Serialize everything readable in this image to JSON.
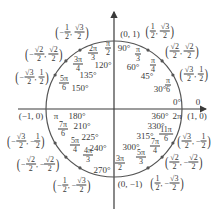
{
  "diagram": {
    "center": {
      "x": 114,
      "y": 109
    },
    "radius": 68,
    "colors": {
      "axis": "#3a3a3a",
      "circle": "#555555",
      "text": "#3a3a3a"
    },
    "axes": {
      "x": {
        "from": 18,
        "to": 206
      },
      "y": {
        "from": 209,
        "to": 12
      }
    },
    "points": [
      {
        "deg": "0°",
        "rad": "0",
        "coord": "(1, 0)"
      },
      {
        "deg": "30°",
        "rad": "π/6",
        "coord": "(√3/2, 1/2)"
      },
      {
        "deg": "45°",
        "rad": "π/4",
        "coord": "(√2/2, √2/2)"
      },
      {
        "deg": "60°",
        "rad": "π/3",
        "coord": "(1/2, √3/2)"
      },
      {
        "deg": "90°",
        "rad": "π/2",
        "coord": "(0, 1)"
      },
      {
        "deg": "120°",
        "rad": "2π/3",
        "coord": "(−1/2, √3/2)"
      },
      {
        "deg": "135°",
        "rad": "3π/4",
        "coord": "(−√2/2, √2/2)"
      },
      {
        "deg": "150°",
        "rad": "5π/6",
        "coord": "(−√3/2, 1/2)"
      },
      {
        "deg": "180°",
        "rad": "π",
        "coord": "(−1, 0)"
      },
      {
        "deg": "210°",
        "rad": "7π/6",
        "coord": "(−√3/2, −1/2)"
      },
      {
        "deg": "225°",
        "rad": "5π/4",
        "coord": "(−√2/2, −√2/2)"
      },
      {
        "deg": "240°",
        "rad": "4π/3",
        "coord": "(−1/2, −√3/2)"
      },
      {
        "deg": "270°",
        "rad": "3π/2",
        "coord": "(0, −1)"
      },
      {
        "deg": "300°",
        "rad": "5π/3",
        "coord": "(1/2, −√3/2)"
      },
      {
        "deg": "315°",
        "rad": "7π/4",
        "coord": "(√2/2, −√2/2)"
      },
      {
        "deg": "330°",
        "rad": "11π/6",
        "coord": "(√3/2, −1/2)"
      },
      {
        "deg": "360°",
        "rad": "2π",
        "coord": "(1, 0)"
      }
    ],
    "labels": {
      "deg0": "0°",
      "rad0": "0",
      "deg30": "30°",
      "rad30_n": "π",
      "rad30_d": "6",
      "deg45": "45°",
      "rad45_n": "π",
      "rad45_d": "4",
      "deg60": "60°",
      "rad60_n": "π",
      "rad60_d": "3",
      "deg90": "90°",
      "rad90_n": "π",
      "rad90_d": "2",
      "deg120": "120°",
      "rad120_n": "2π",
      "rad120_d": "3",
      "deg135": "135°",
      "rad135_n": "3π",
      "rad135_d": "4",
      "deg150": "150°",
      "rad150_n": "5π",
      "rad150_d": "6",
      "deg180": "180°",
      "rad180": "π",
      "deg210": "210°",
      "rad210_n": "7π",
      "rad210_d": "6",
      "deg225": "225°",
      "rad225_n": "5π",
      "rad225_d": "4",
      "deg240": "240°",
      "rad240_n": "4π",
      "rad240_d": "3",
      "deg270": "270°",
      "rad270_n": "3π",
      "rad270_d": "2",
      "deg300": "300°",
      "rad300_n": "5π",
      "rad300_d": "3",
      "deg315": "315°",
      "rad315_n": "7π",
      "rad315_d": "4",
      "deg330": "330°",
      "rad330_n": "11π",
      "rad330_d": "6",
      "deg360": "360°",
      "rad360": "2π",
      "c0": "(1, 0)",
      "c90": "(0, 1)",
      "c180": "(−1, 0)",
      "c270": "(0, −1)",
      "half": "1",
      "two": "2",
      "sqrt3": "√3",
      "sqrt2": "√2",
      "neg": "−",
      "comma": ","
    }
  }
}
